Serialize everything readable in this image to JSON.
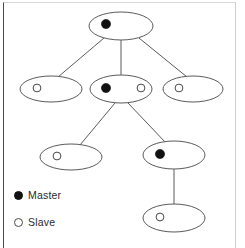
{
  "diagram": {
    "type": "tree",
    "title": "",
    "node_shape": "ellipse",
    "edge_style": "straight-line",
    "background_color": "#ffffff",
    "node_stroke_color": "#5b5b5b",
    "edge_color": "#5b5b5b",
    "master_marker_color": "#111111",
    "slave_marker_color": "#ffffff",
    "nodes": [
      {
        "id": "n0",
        "label": "",
        "roles": [
          "master"
        ],
        "cx": 121,
        "cy": 26,
        "rx": 32,
        "ry": 14
      },
      {
        "id": "n1",
        "label": "",
        "roles": [
          "slave"
        ],
        "cx": 51,
        "cy": 89,
        "rx": 31,
        "ry": 13
      },
      {
        "id": "n2",
        "label": "",
        "roles": [
          "master",
          "slave"
        ],
        "cx": 121,
        "cy": 89,
        "rx": 31,
        "ry": 14
      },
      {
        "id": "n3",
        "label": "",
        "roles": [
          "slave"
        ],
        "cx": 193,
        "cy": 89,
        "rx": 30,
        "ry": 13
      },
      {
        "id": "n4",
        "label": "",
        "roles": [
          "slave"
        ],
        "cx": 71,
        "cy": 157,
        "rx": 31,
        "ry": 13
      },
      {
        "id": "n5",
        "label": "",
        "roles": [
          "master"
        ],
        "cx": 174,
        "cy": 155,
        "rx": 31,
        "ry": 14
      },
      {
        "id": "n6",
        "label": "",
        "roles": [
          "slave"
        ],
        "cx": 174,
        "cy": 218,
        "rx": 31,
        "ry": 14
      }
    ],
    "edges": [
      {
        "from": "n0",
        "to": "n1"
      },
      {
        "from": "n0",
        "to": "n2"
      },
      {
        "from": "n0",
        "to": "n3"
      },
      {
        "from": "n2",
        "to": "n4"
      },
      {
        "from": "n2",
        "to": "n5"
      },
      {
        "from": "n5",
        "to": "n6"
      }
    ]
  },
  "legend": {
    "items": [
      {
        "marker": "filled-circle",
        "label": "Master",
        "color": "#111111"
      },
      {
        "marker": "hollow-circle",
        "label": "Slave",
        "color": "#ffffff"
      }
    ]
  }
}
